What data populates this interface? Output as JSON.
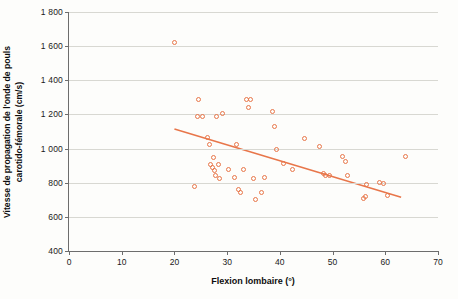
{
  "chart_data": {
    "type": "scatter",
    "title": "",
    "xlabel": "Flexion lombaire (°)",
    "ylabel_line1": "Vitesse de propagation de l'onde de pouls",
    "ylabel_line2": "carotido-fémorale (cm/s)",
    "xlim": [
      0,
      70
    ],
    "ylim": [
      400,
      1800
    ],
    "xticks": [
      0,
      10,
      20,
      30,
      40,
      50,
      60,
      70
    ],
    "xtick_labels": [
      "0",
      "10",
      "20",
      "30",
      "40",
      "50",
      "60",
      "70"
    ],
    "yticks": [
      400,
      600,
      800,
      1000,
      1200,
      1400,
      1600,
      1800
    ],
    "ytick_labels": [
      "400",
      "600",
      "800",
      "1 000",
      "1 200",
      "1 400",
      "1 600",
      "1 800"
    ],
    "grid": "horizontal",
    "legend": "none",
    "marker_color": "#e8764a",
    "line_color": "#e8764a",
    "axis_color": "#6d6d6d",
    "points": [
      [
        20.0,
        1620
      ],
      [
        23.8,
        775
      ],
      [
        24.3,
        1185
      ],
      [
        24.6,
        1290
      ],
      [
        25.4,
        1185
      ],
      [
        26.3,
        1065
      ],
      [
        26.6,
        1025
      ],
      [
        26.9,
        905
      ],
      [
        27.2,
        890
      ],
      [
        27.4,
        950
      ],
      [
        27.6,
        870
      ],
      [
        27.8,
        840
      ],
      [
        28.0,
        1185
      ],
      [
        28.3,
        905
      ],
      [
        28.6,
        825
      ],
      [
        29.2,
        1205
      ],
      [
        30.3,
        875
      ],
      [
        31.4,
        830
      ],
      [
        31.7,
        1025
      ],
      [
        32.1,
        760
      ],
      [
        32.6,
        745
      ],
      [
        33.1,
        880
      ],
      [
        33.6,
        1285
      ],
      [
        34.0,
        1240
      ],
      [
        34.4,
        1285
      ],
      [
        35.0,
        825
      ],
      [
        35.4,
        700
      ],
      [
        36.6,
        745
      ],
      [
        37.0,
        830
      ],
      [
        38.6,
        1215
      ],
      [
        39.0,
        1130
      ],
      [
        39.3,
        995
      ],
      [
        40.6,
        910
      ],
      [
        42.4,
        880
      ],
      [
        44.6,
        1060
      ],
      [
        47.6,
        1015
      ],
      [
        48.3,
        855
      ],
      [
        48.6,
        845
      ],
      [
        49.4,
        845
      ],
      [
        51.9,
        955
      ],
      [
        52.4,
        925
      ],
      [
        52.9,
        845
      ],
      [
        55.9,
        705
      ],
      [
        56.2,
        720
      ],
      [
        56.4,
        790
      ],
      [
        58.9,
        800
      ],
      [
        59.6,
        795
      ],
      [
        60.4,
        725
      ],
      [
        63.9,
        955
      ]
    ],
    "trendline": {
      "x1": 20.0,
      "y1": 1115,
      "x2": 63.0,
      "y2": 715
    }
  }
}
